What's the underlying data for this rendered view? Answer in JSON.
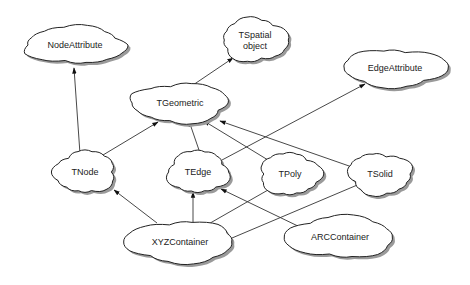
{
  "diagram": {
    "type": "class-hierarchy",
    "nodes": [
      {
        "id": "NodeAttribute",
        "lines": [
          "NodeAttribute"
        ],
        "x": 75,
        "y": 45,
        "w": 100,
        "h": 36
      },
      {
        "id": "TSpatialObject",
        "lines": [
          "TSpatial",
          "object"
        ],
        "x": 255,
        "y": 40,
        "w": 64,
        "h": 42
      },
      {
        "id": "EdgeAttribute",
        "lines": [
          "EdgeAttribute"
        ],
        "x": 395,
        "y": 68,
        "w": 104,
        "h": 36
      },
      {
        "id": "TGeometric",
        "lines": [
          "TGeometric"
        ],
        "x": 180,
        "y": 103,
        "w": 96,
        "h": 38
      },
      {
        "id": "TNode",
        "lines": [
          "TNode"
        ],
        "x": 85,
        "y": 172,
        "w": 60,
        "h": 40
      },
      {
        "id": "TEdge",
        "lines": [
          "TEdge"
        ],
        "x": 198,
        "y": 172,
        "w": 60,
        "h": 40
      },
      {
        "id": "TPoly",
        "lines": [
          "TPoly"
        ],
        "x": 290,
        "y": 174,
        "w": 60,
        "h": 40
      },
      {
        "id": "TSolid",
        "lines": [
          "TSolid"
        ],
        "x": 380,
        "y": 174,
        "w": 62,
        "h": 40
      },
      {
        "id": "XYZContainer",
        "lines": [
          "XYZContainer"
        ],
        "x": 180,
        "y": 242,
        "w": 108,
        "h": 40
      },
      {
        "id": "ARCContainer",
        "lines": [
          "ARCContainer"
        ],
        "x": 340,
        "y": 237,
        "w": 108,
        "h": 40
      }
    ],
    "edges": [
      {
        "from": "TNode",
        "to": "NodeAttribute",
        "x1": 80,
        "y1": 154,
        "x2": 74,
        "y2": 68
      },
      {
        "from": "TNode",
        "to": "TGeometric",
        "x1": 103,
        "y1": 155,
        "x2": 158,
        "y2": 122
      },
      {
        "from": "TGeometric",
        "to": "TSpatialObject",
        "x1": 193,
        "y1": 85,
        "x2": 233,
        "y2": 58
      },
      {
        "from": "TEdge",
        "to": "TGeometric",
        "x1": 200,
        "y1": 153,
        "x2": 189,
        "y2": 121
      },
      {
        "from": "TEdge",
        "to": "EdgeAttribute",
        "x1": 222,
        "y1": 160,
        "x2": 365,
        "y2": 84
      },
      {
        "from": "TPoly",
        "to": "TGeometric",
        "x1": 268,
        "y1": 160,
        "x2": 204,
        "y2": 121
      },
      {
        "from": "TSolid",
        "to": "TGeometric",
        "x1": 352,
        "y1": 167,
        "x2": 220,
        "y2": 121
      },
      {
        "from": "XYZContainer",
        "to": "TNode",
        "x1": 157,
        "y1": 223,
        "x2": 114,
        "y2": 190
      },
      {
        "from": "XYZContainer",
        "to": "TEdge",
        "x1": 193,
        "y1": 223,
        "x2": 193,
        "y2": 192
      },
      {
        "from": "XYZContainer",
        "to": "TPoly",
        "x1": 205,
        "y1": 226,
        "x2": 275,
        "y2": 186
      },
      {
        "from": "XYZContainer",
        "to": "TSolid",
        "x1": 232,
        "y1": 238,
        "x2": 362,
        "y2": 183
      },
      {
        "from": "ARCContainer",
        "to": "TEdge",
        "x1": 302,
        "y1": 228,
        "x2": 221,
        "y2": 189
      }
    ]
  }
}
